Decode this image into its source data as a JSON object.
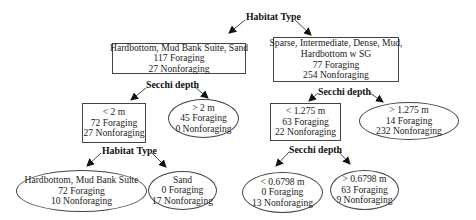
{
  "diagram": {
    "type": "decision-tree",
    "root_split": {
      "label": "Habitat Type"
    },
    "nodes": {
      "hab_left": {
        "lines": [
          "Hardbottom, Mud Bank Suite, Sand",
          "117 Foraging",
          "27 Nonforaging"
        ],
        "shape": "rect"
      },
      "hab_right": {
        "lines": [
          "Sparse, Intermediate, Dense, Mud,",
          "Hardbottom w SG",
          "77 Foraging",
          "254 Nonforaging"
        ],
        "shape": "rect"
      },
      "secchi_left_split": {
        "label": "Secchi depth"
      },
      "secchi_right_split": {
        "label": "Secchi depth"
      },
      "lt2m": {
        "lines": [
          "< 2 m",
          "72 Foraging",
          "27 Nonforaging"
        ],
        "shape": "rect"
      },
      "gt2m": {
        "lines": [
          "> 2 m",
          "45 Foraging",
          "0 Nonforaging"
        ],
        "shape": "ellipse"
      },
      "lt1275": {
        "lines": [
          "< 1.275 m",
          "63 Foraging",
          "22 Nonforaging"
        ],
        "shape": "rect"
      },
      "gt1275": {
        "lines": [
          "> 1.275 m",
          "14 Foraging",
          "232 Nonforaging"
        ],
        "shape": "ellipse"
      },
      "habitat_bottom_split": {
        "label": "Habitat Type"
      },
      "secchi_bottom_split": {
        "label": "Secchi depth"
      },
      "hb_mbs": {
        "lines": [
          "Hardbottom, Mud Bank Suite",
          "72 Foraging",
          "10 Nonforaging"
        ],
        "shape": "ellipse"
      },
      "sand": {
        "lines": [
          "Sand",
          "0 Foraging",
          "17 Nonforaging"
        ],
        "shape": "ellipse"
      },
      "lt06798": {
        "lines": [
          "< 0.6798 m",
          "0 Foraging",
          "13 Nonforaging"
        ],
        "shape": "ellipse"
      },
      "gt06798": {
        "lines": [
          "> 0.6798 m",
          "63 Foraging",
          "9 Nonforaging"
        ],
        "shape": "ellipse"
      }
    },
    "colors": {
      "line": "#333333",
      "border": "#444444",
      "background": "#ffffff",
      "text": "#222222"
    }
  }
}
